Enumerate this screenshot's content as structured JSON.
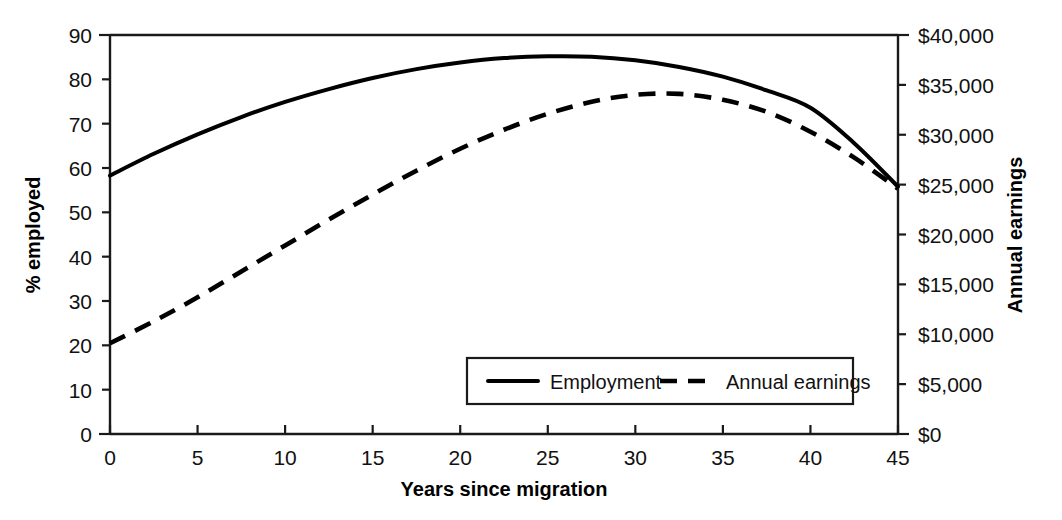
{
  "chart_data": {
    "type": "line",
    "title": "",
    "xlabel": "Years since migration",
    "ylabel": "% employed",
    "y2label": "Annual earnings",
    "xlim": [
      0,
      45
    ],
    "ylim": [
      0,
      90
    ],
    "y2lim": [
      0,
      40000
    ],
    "grid": false,
    "legend_position": "inside-bottom-center",
    "x_ticks": [
      "0",
      "5",
      "10",
      "15",
      "20",
      "25",
      "30",
      "35",
      "40",
      "45"
    ],
    "x_tick_values": [
      0,
      5,
      10,
      15,
      20,
      25,
      30,
      35,
      40,
      45
    ],
    "y_ticks": [
      "0",
      "10",
      "20",
      "30",
      "40",
      "50",
      "60",
      "70",
      "80",
      "90"
    ],
    "y_tick_values": [
      0,
      10,
      20,
      30,
      40,
      50,
      60,
      70,
      80,
      90
    ],
    "y2_ticks": [
      "$0",
      "$5,000",
      "$10,000",
      "$15,000",
      "$20,000",
      "$25,000",
      "$30,000",
      "$35,000",
      "$40,000"
    ],
    "y2_tick_values": [
      0,
      5000,
      10000,
      15000,
      20000,
      25000,
      30000,
      35000,
      40000
    ],
    "x": [
      0,
      2.5,
      5,
      7.5,
      10,
      12.5,
      15,
      17.5,
      20,
      22.5,
      25,
      27.5,
      30,
      32.5,
      35,
      37.5,
      40,
      42.5,
      45
    ],
    "series": [
      {
        "name": "Employment",
        "axis": "left",
        "style": "solid",
        "units": "% employed",
        "values": [
          58.3,
          63.2,
          67.6,
          71.5,
          74.9,
          77.8,
          80.3,
          82.3,
          83.8,
          84.8,
          85.2,
          85.1,
          84.3,
          82.8,
          80.6,
          77.5,
          73.6,
          65.6,
          55.8
        ]
      },
      {
        "name": "Annual earnings",
        "axis": "right",
        "style": "dashed",
        "units": "dollars",
        "values": [
          9100,
          11300,
          13700,
          16300,
          18900,
          21500,
          24000,
          26400,
          28600,
          30500,
          32100,
          33300,
          34000,
          34100,
          33500,
          32300,
          30300,
          27700,
          24600
        ]
      }
    ],
    "legend": [
      {
        "label": "Employment",
        "style": "solid"
      },
      {
        "label": "Annual earnings",
        "style": "dashed"
      }
    ]
  },
  "colors": {
    "line": "#000000",
    "axis": "#1a1a1a",
    "background": "#ffffff"
  }
}
